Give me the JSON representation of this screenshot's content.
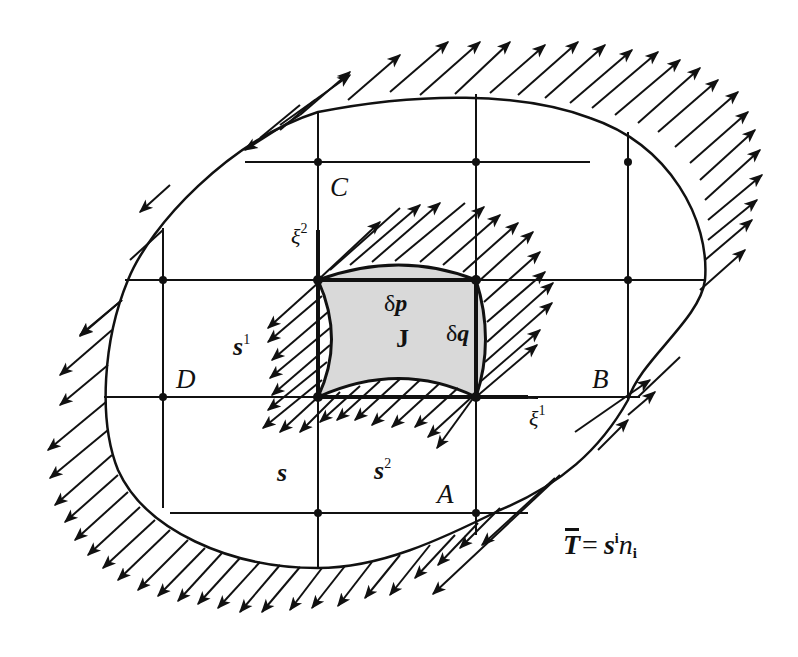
{
  "figure": {
    "type": "continuum-body-stress-vector-diagram",
    "colors": {
      "line": "#111111",
      "shaded_cell": "#d9d9d9",
      "background": "#ffffff"
    }
  },
  "labels": {
    "point_C": "C",
    "point_D": "D",
    "point_B": "B",
    "point_A": "A",
    "xi2_base": "ξ",
    "xi2_sup": "2",
    "xi1_base": "ξ",
    "xi1_sup": "1",
    "delta_p": "δp",
    "delta_p_d": "δ",
    "delta_p_v": "p",
    "delta_q_d": "δ",
    "delta_q_v": "q",
    "jacobian": "J",
    "s1_base": "s",
    "s1_sup": "1",
    "s2_base": "s",
    "s2_sup": "2",
    "s_vec": "s",
    "traction_T": "T",
    "traction_eq": "=",
    "traction_s": "s",
    "traction_sup": "i",
    "traction_n": "n",
    "traction_sub": "i"
  },
  "grid": {
    "vertical_lines_x": [
      163,
      318,
      476,
      628
    ],
    "horizontal_lines_y": [
      162,
      280,
      397,
      513
    ],
    "shaded_cell": {
      "x1": 318,
      "y1": 280,
      "x2": 476,
      "y2": 397
    }
  }
}
